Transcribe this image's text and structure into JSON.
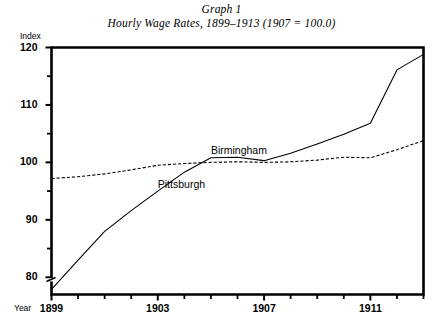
{
  "title": {
    "line1": "Graph 1",
    "line2": "Hourly Wage Rates, 1899–1913 (1907 = 100.0)"
  },
  "axes": {
    "y_axis_name": "Index",
    "x_axis_name": "Year",
    "y_ticks": [
      "120",
      "110",
      "100",
      "90",
      "80"
    ],
    "x_ticks": [
      "1899",
      "1903",
      "1907",
      "1911"
    ]
  },
  "series_labels": {
    "birmingham": "Birmingham",
    "pittsburgh": "Pittsburgh"
  },
  "colors": {
    "ink": "#000000",
    "background": "#ffffff"
  },
  "chart_data": {
    "type": "line",
    "title": "Hourly Wage Rates, 1899–1913 (1907 = 100.0)",
    "subtitle": "Graph 1",
    "xlabel": "Year",
    "ylabel": "Index",
    "xlim": [
      1899,
      1913
    ],
    "ylim": [
      77,
      120
    ],
    "grid": false,
    "legend": "inline-annotations",
    "y_major_ticks": [
      80,
      90,
      100,
      110,
      120
    ],
    "y_minor_ticks": [
      85,
      95,
      105,
      115
    ],
    "x_major_ticks": [
      1899,
      1903,
      1907,
      1911
    ],
    "x_minor_ticks": [
      1900,
      1901,
      1902,
      1904,
      1905,
      1906,
      1908,
      1909,
      1910,
      1912,
      1913
    ],
    "axis_break_on_y": true,
    "x": [
      1899,
      1900,
      1901,
      1902,
      1903,
      1904,
      1905,
      1906,
      1907,
      1908,
      1909,
      1910,
      1911,
      1912,
      1913
    ],
    "series": [
      {
        "name": "Pittsburgh",
        "style": "solid",
        "values": [
          77.9,
          83.0,
          88.0,
          91.6,
          95.0,
          98.3,
          100.8,
          100.9,
          100.3,
          101.6,
          103.2,
          104.9,
          106.8,
          116.1,
          118.8
        ]
      },
      {
        "name": "Birmingham",
        "style": "dashed",
        "values": [
          97.2,
          97.5,
          98.0,
          98.7,
          99.5,
          99.8,
          100.0,
          100.1,
          100.0,
          100.1,
          100.4,
          100.9,
          100.8,
          102.2,
          103.8
        ]
      }
    ]
  }
}
